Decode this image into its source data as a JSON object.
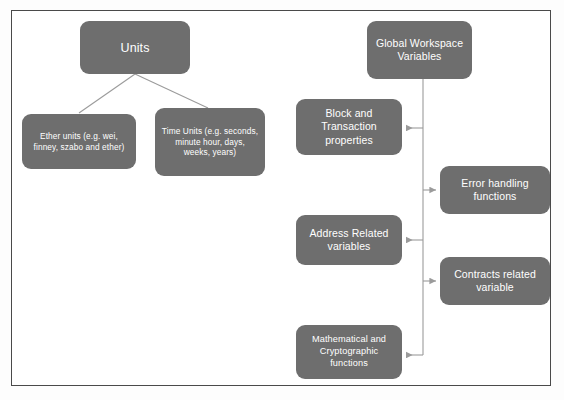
{
  "diagram": {
    "type": "tree-diagram",
    "frame": {
      "border_color": "#4a4a4a",
      "background_color": "#ffffff"
    },
    "node_style": {
      "fill_color": "#6e6e6e",
      "text_color": "#ffffff",
      "shape": "rounded-rectangle"
    },
    "connector_style": {
      "line_color": "#9b9b9b",
      "arrow_color": "#9b9b9b"
    },
    "nodes": [
      {
        "id": "units",
        "label": "Units",
        "role": "root"
      },
      {
        "id": "ether-units",
        "label": "Ether units (e.g. wei, finney, szabo and ether)",
        "role": "child"
      },
      {
        "id": "time-units",
        "label": "Time Units (e.g. seconds, minute hour, days, weeks, years)",
        "role": "child"
      },
      {
        "id": "global-workspace",
        "label": "Global Workspace Variables",
        "role": "root"
      },
      {
        "id": "block-transaction",
        "label": "Block and Transaction properties",
        "role": "child"
      },
      {
        "id": "error-handling",
        "label": "Error handling functions",
        "role": "child"
      },
      {
        "id": "address-related",
        "label": "Address Related variables",
        "role": "child"
      },
      {
        "id": "contracts-related",
        "label": "Contracts related variable",
        "role": "child"
      },
      {
        "id": "math-crypto",
        "label": "Mathematical and Cryptographic functions",
        "role": "child"
      }
    ],
    "edges": [
      {
        "from": "units",
        "to": "ether-units",
        "style": "diagonal-line"
      },
      {
        "from": "units",
        "to": "time-units",
        "style": "diagonal-line"
      },
      {
        "from": "global-workspace",
        "to": "block-transaction",
        "style": "elbow-arrow-left"
      },
      {
        "from": "global-workspace",
        "to": "error-handling",
        "style": "elbow-arrow-right"
      },
      {
        "from": "global-workspace",
        "to": "address-related",
        "style": "elbow-arrow-left"
      },
      {
        "from": "global-workspace",
        "to": "contracts-related",
        "style": "elbow-arrow-right"
      },
      {
        "from": "global-workspace",
        "to": "math-crypto",
        "style": "elbow-arrow-left"
      }
    ]
  }
}
